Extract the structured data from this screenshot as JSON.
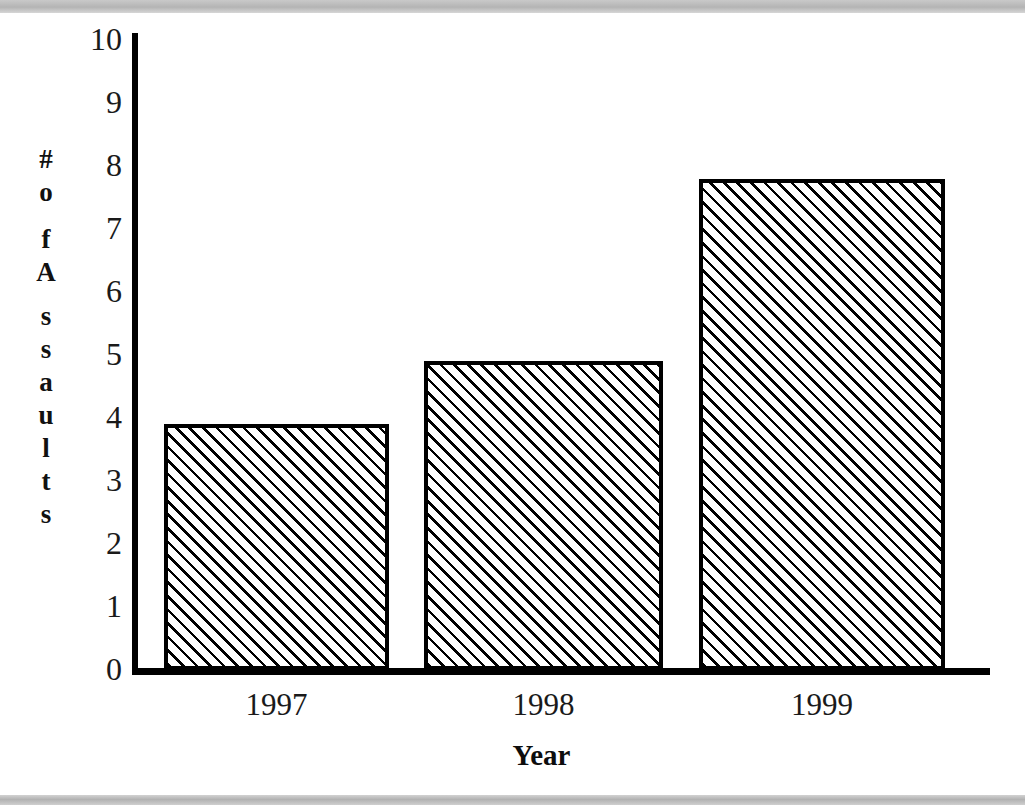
{
  "page": {
    "background_color": "#ffffff",
    "band_color": "#b9b9b9",
    "ink_color": "#000000"
  },
  "chart_data": {
    "type": "bar",
    "title": "",
    "categories": [
      "1997",
      "1998",
      "1999"
    ],
    "values": [
      3.9,
      4.9,
      7.8
    ],
    "series": [
      {
        "name": "# of Assaults",
        "values": [
          3.9,
          4.9,
          7.8
        ]
      }
    ],
    "xlabel": "Year",
    "ylabel": "# of Assaults",
    "ylim": [
      0,
      10
    ],
    "ytick_values": [
      0,
      1,
      2,
      3,
      4,
      5,
      6,
      7,
      8,
      9,
      10
    ],
    "ytick_labels": [
      "0",
      "1",
      "2",
      "3",
      "4",
      "5",
      "6",
      "7",
      "8",
      "9",
      "10"
    ],
    "grid": false,
    "legend": false,
    "bar_fill": "diagonal-hatch",
    "bar_edge_color": "#000000"
  },
  "yaxis": {
    "title_glyphs": [
      "#",
      "o",
      "f",
      "A",
      "s",
      "s",
      "a",
      "u",
      "l",
      "t",
      "s"
    ],
    "ticks": [
      {
        "value": 10,
        "label": "10"
      },
      {
        "value": 9,
        "label": "9"
      },
      {
        "value": 8,
        "label": "8"
      },
      {
        "value": 7,
        "label": "7"
      },
      {
        "value": 6,
        "label": "6"
      },
      {
        "value": 5,
        "label": "5"
      },
      {
        "value": 4,
        "label": "4"
      },
      {
        "value": 3,
        "label": "3"
      },
      {
        "value": 2,
        "label": "2"
      },
      {
        "value": 1,
        "label": "1"
      },
      {
        "value": 0,
        "label": "0"
      }
    ]
  },
  "xaxis": {
    "title": "Year",
    "ticks": [
      {
        "label": "1997"
      },
      {
        "label": "1998"
      },
      {
        "label": "1999"
      }
    ]
  },
  "bars": [
    {
      "category": "1997",
      "value": 3.9,
      "left": 164,
      "width": 225
    },
    {
      "category": "1998",
      "value": 4.9,
      "left": 424,
      "width": 239
    },
    {
      "category": "1999",
      "value": 7.8,
      "left": 699,
      "width": 246
    }
  ],
  "geometry": {
    "baseline_y": 670,
    "unit_px": 63,
    "axis_x": 135
  }
}
